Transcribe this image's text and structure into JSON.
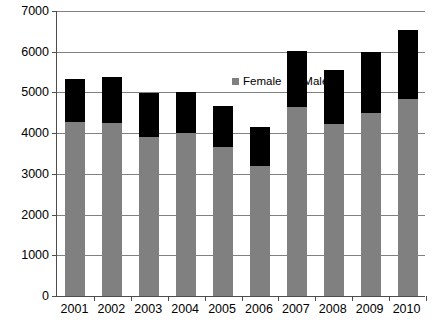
{
  "chart_data": {
    "type": "bar",
    "subtype": "stacked-vertical",
    "title": "",
    "xlabel": "",
    "ylabel": "",
    "ylim": [
      0,
      7000
    ],
    "ytick_step": 1000,
    "yticks": [
      "0",
      "1000",
      "2000",
      "3000",
      "4000",
      "5000",
      "6000",
      "7000"
    ],
    "grid": true,
    "legend_position": "inside-top-center",
    "categories": [
      "2001",
      "2002",
      "2003",
      "2004",
      "2005",
      "2006",
      "2007",
      "2008",
      "2009",
      "2010"
    ],
    "series": [
      {
        "name": "Female",
        "color": "#808080",
        "values": [
          4250,
          4230,
          3900,
          4000,
          3640,
          3180,
          4630,
          4200,
          4490,
          4830
        ]
      },
      {
        "name": "Male",
        "color": "#000000",
        "values": [
          1050,
          1140,
          1070,
          990,
          1010,
          950,
          1360,
          1330,
          1490,
          1680
        ]
      }
    ],
    "totals": [
      5300,
      5370,
      4970,
      4990,
      4650,
      4130,
      5990,
      5530,
      5980,
      6510
    ]
  },
  "axis": {
    "line_color": "#4d4d4d",
    "grid_color": "#818181"
  },
  "legend": {
    "entries": [
      {
        "label": "Female",
        "color": "#808080"
      },
      {
        "label": "Male",
        "color": "#000000"
      }
    ]
  }
}
